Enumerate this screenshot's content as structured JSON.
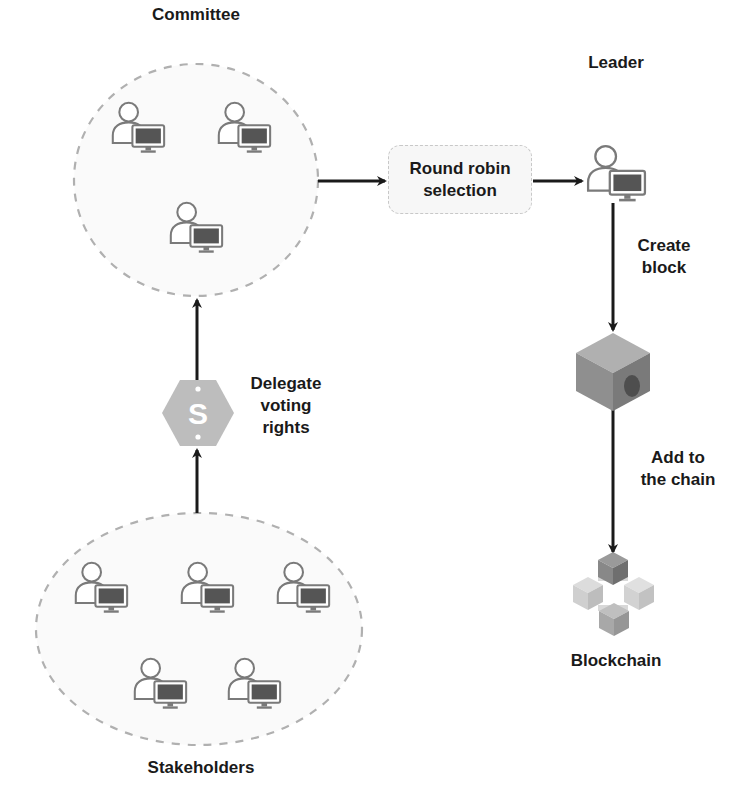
{
  "diagram": {
    "colors": {
      "background": "#ffffff",
      "arrow": "#1a1a1a",
      "ellipse_border": "#b0b0b0",
      "ellipse_fill": "#fafafa",
      "icon_stroke": "#7a7a7a",
      "monitor_screen": "#555555",
      "box_fill": "#f7f7f7",
      "box_border": "#c8c8c8",
      "cube_light": "#a6a6a6",
      "cube_dark": "#7a7a7a",
      "hexagon_fill": "#bdbdbd"
    },
    "groups": {
      "committee": {
        "label": "Committee",
        "member_count": 3
      },
      "stakeholders": {
        "label": "Stakeholders",
        "member_count": 5
      }
    },
    "nodes": {
      "round_robin": {
        "label_line1": "Round robin",
        "label_line2": "selection"
      },
      "leader": {
        "label": "Leader"
      },
      "block": {
        "icon": "cube-icon"
      },
      "blockchain": {
        "label": "Blockchain",
        "icon": "blockchain-icon"
      },
      "delegate": {
        "icon": "dollar-hexagon-icon"
      }
    },
    "edges": [
      {
        "from": "stakeholders",
        "to": "committee",
        "label_lines": [
          "Delegate",
          "voting",
          "rights"
        ]
      },
      {
        "from": "committee",
        "to": "round_robin",
        "label_lines": []
      },
      {
        "from": "round_robin",
        "to": "leader",
        "label_lines": []
      },
      {
        "from": "leader",
        "to": "block",
        "label_lines": [
          "Create",
          "block"
        ]
      },
      {
        "from": "block",
        "to": "blockchain",
        "label_lines": [
          "Add to",
          "the chain"
        ]
      }
    ]
  }
}
